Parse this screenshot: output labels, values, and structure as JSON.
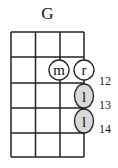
{
  "chord": {
    "name": "G",
    "strings": 4,
    "frets_shown": 5,
    "fret_labels": [
      {
        "label": "12",
        "row": 2
      },
      {
        "label": "13",
        "row": 3
      },
      {
        "label": "14",
        "row": 4
      }
    ],
    "dots": [
      {
        "string": 3,
        "fret_row": 2,
        "finger": "m",
        "filled": false
      },
      {
        "string": 4,
        "fret_row": 2,
        "finger": "r",
        "filled": false
      },
      {
        "string": 4,
        "fret_row": 3,
        "finger": "l",
        "filled": true
      },
      {
        "string": 4,
        "fret_row": 4,
        "finger": "l",
        "filled": true
      }
    ],
    "colors": {
      "line": "#222222",
      "dot_fill": "#d9d9d9",
      "open_fill": "#ffffff"
    }
  }
}
